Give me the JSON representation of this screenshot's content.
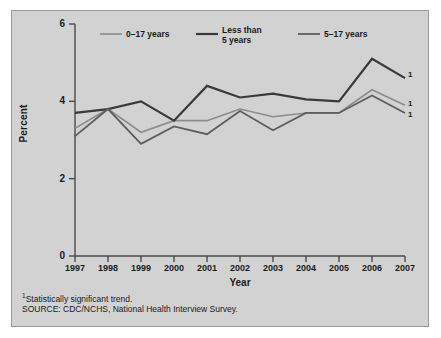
{
  "figure": {
    "panel_bg": "#d2d2d2",
    "panel_border": "#9a9a9a",
    "page_bg": "#ffffff"
  },
  "legend": {
    "position": "top-inside",
    "entries": [
      {
        "label": "0–17 years",
        "color": "#8c8c8c",
        "swatch_name": "legend-swatch-0-17"
      },
      {
        "label": "Less than\n5 years",
        "color": "#3a3a3a",
        "swatch_name": "legend-swatch-less-than-5"
      },
      {
        "label": "5–17 years",
        "color": "#5e5e5e",
        "swatch_name": "legend-swatch-5-17"
      }
    ]
  },
  "endnote_markers": [
    {
      "label": "1"
    },
    {
      "label": "1"
    },
    {
      "label": "1"
    }
  ],
  "footnotes": {
    "line1_sup": "1",
    "line1": "Statistically significant trend.",
    "line2": "SOURCE: CDC/NCHS, National Health Interview Survey."
  },
  "chart_data": {
    "type": "line",
    "title": "",
    "subtitle": "",
    "xlabel": "Year",
    "ylabel": "Percent",
    "x": [
      1997,
      1998,
      1999,
      2000,
      2001,
      2002,
      2003,
      2004,
      2005,
      2006,
      2007
    ],
    "xticklabels": [
      "1997",
      "1998",
      "1999",
      "2000",
      "2001",
      "2002",
      "2003",
      "2004",
      "2005",
      "2006",
      "2007"
    ],
    "yticks": [
      0,
      2,
      4,
      6
    ],
    "yticklabels": [
      "0",
      "2",
      "4",
      "6"
    ],
    "ylim": [
      0,
      6
    ],
    "xlim": [
      1997,
      2007
    ],
    "grid": false,
    "series": [
      {
        "name": "0–17 years",
        "color": "#8c8c8c",
        "width": 1.6,
        "values": [
          3.3,
          3.8,
          3.2,
          3.5,
          3.5,
          3.8,
          3.6,
          3.7,
          3.7,
          4.3,
          3.9
        ]
      },
      {
        "name": "Less than 5 years",
        "color": "#3a3a3a",
        "width": 2.2,
        "values": [
          3.7,
          3.8,
          4.0,
          3.5,
          4.4,
          4.1,
          4.2,
          4.05,
          4.0,
          5.1,
          4.6
        ]
      },
      {
        "name": "5–17 years",
        "color": "#5e5e5e",
        "width": 1.8,
        "values": [
          3.1,
          3.8,
          2.9,
          3.35,
          3.15,
          3.75,
          3.25,
          3.7,
          3.7,
          4.15,
          3.7
        ]
      }
    ]
  }
}
